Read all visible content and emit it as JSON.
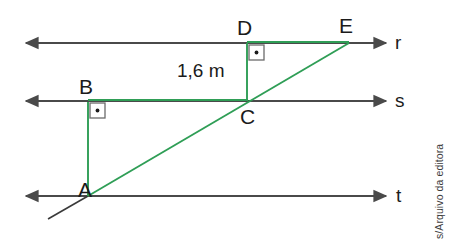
{
  "figure": {
    "background_color": "#ffffff",
    "line_color": "#4a4a4a",
    "accent_color": "#2f9e56",
    "label_color": "#1b1b1b",
    "parallel_lines": [
      {
        "name": "r",
        "label": "r",
        "y": 43
      },
      {
        "name": "s",
        "label": "s",
        "y": 101
      },
      {
        "name": "t",
        "label": "t",
        "y": 196
      }
    ],
    "points": [
      {
        "name": "A",
        "label": "A",
        "x": 88,
        "y": 196,
        "on_line": "t"
      },
      {
        "name": "B",
        "label": "B",
        "x": 88,
        "y": 103,
        "on_line": "s"
      },
      {
        "name": "C",
        "label": "C",
        "x": 247,
        "y": 101,
        "on_line": "s"
      },
      {
        "name": "D",
        "label": "D",
        "x": 247,
        "y": 43,
        "on_line": "r"
      },
      {
        "name": "E",
        "label": "E",
        "x": 348,
        "y": 43,
        "on_line": "r"
      }
    ],
    "segments": [
      {
        "name": "AB",
        "from": "A",
        "to": "B",
        "color": "#2f9e56"
      },
      {
        "name": "BC",
        "from": "B",
        "to": "C",
        "color": "#2f9e56"
      },
      {
        "name": "CD",
        "from": "C",
        "to": "D",
        "color": "#2f9e56"
      },
      {
        "name": "DE",
        "from": "D",
        "to": "E",
        "color": "#2f9e56"
      },
      {
        "name": "AE",
        "from": "A",
        "to": "E",
        "color": "#2f9e56"
      }
    ],
    "right_angles": [
      {
        "name": "angle-at-B",
        "vertex": "B"
      },
      {
        "name": "angle-at-D",
        "vertex": "D"
      }
    ],
    "measurements": [
      {
        "name": "CD-length",
        "label": "1,6 m",
        "segment": "CD"
      }
    ]
  },
  "credit": {
    "text": "Banco de imagens/Arquivo da editora"
  }
}
